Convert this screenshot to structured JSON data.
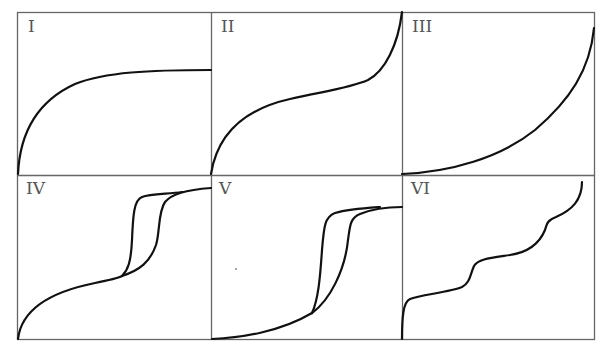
{
  "figure": {
    "frame_color": "#666666",
    "curve_color": "#111111",
    "panels": [
      {
        "label": "I",
        "shape": "Rapid rise then flat plateau (Langmuir-type)"
      },
      {
        "label": "II",
        "shape": "Sigmoidal rise, steep at the end"
      },
      {
        "label": "III",
        "shape": "Convex, slow start then steep rise"
      },
      {
        "label": "IV",
        "shape": "Rise with hysteresis loop then plateau"
      },
      {
        "label": "V",
        "shape": "Convex start with hysteresis loop then plateau"
      },
      {
        "label": "VI",
        "shape": "Stepwise rise"
      }
    ]
  }
}
